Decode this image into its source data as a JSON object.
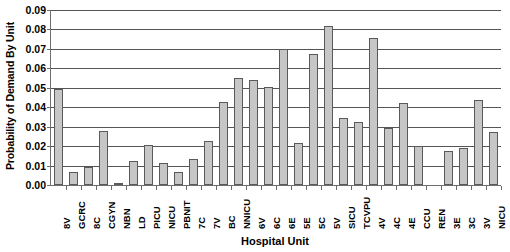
{
  "chart_data": {
    "type": "bar",
    "title": "",
    "xlabel": "Hospital Unit",
    "ylabel": "Probability of Demand By Unit",
    "ylim": [
      0,
      0.09
    ],
    "ytick_labels": [
      "0.09",
      "0.08",
      "0.07",
      "0.06",
      "0.05",
      "0.04",
      "0.03",
      "0.02",
      "0.01",
      "0.00"
    ],
    "ytick_values": [
      0.09,
      0.08,
      0.07,
      0.06,
      0.05,
      0.04,
      0.03,
      0.02,
      0.01,
      0.0
    ],
    "grid": true,
    "legend": null,
    "bar_color": "#c6c6c6",
    "bar_border_color": "#5a5a5a",
    "categories": [
      "8V",
      "GCRC",
      "8C",
      "CGYN",
      "NBN",
      "LD",
      "PICU",
      "NICU",
      "PBNIT",
      "7C",
      "7V",
      "BC",
      "NNICU",
      "6V",
      "6C",
      "6E",
      "5E",
      "5C",
      "5V",
      "SICU",
      "TCVPU",
      "4V",
      "4C",
      "4E",
      "CCU",
      "REN",
      "3E",
      "3C",
      "3V",
      "NICU"
    ],
    "values": [
      0.0495,
      0.0065,
      0.0095,
      0.028,
      0.0005,
      0.0125,
      0.0205,
      0.0115,
      0.0065,
      0.0135,
      0.0225,
      0.0425,
      0.055,
      0.054,
      0.0505,
      0.07,
      0.0215,
      0.0675,
      0.082,
      0.0345,
      0.0325,
      0.0755,
      0.0295,
      0.042,
      0.02,
      0.0,
      0.0175,
      0.019,
      0.0435,
      0.0275
    ]
  }
}
